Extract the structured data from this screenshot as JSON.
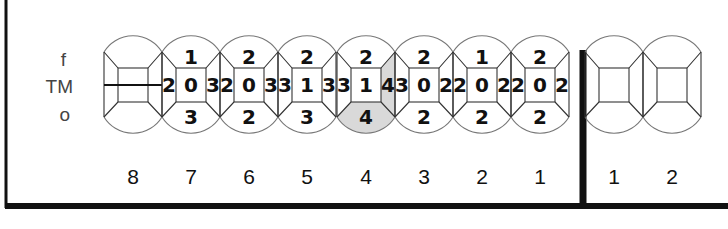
{
  "row_labels": {
    "top": "f",
    "middle": "TM",
    "bottom": "o"
  },
  "colors": {
    "line": "#111111",
    "outline": "#777777",
    "shade": "#d9d9d9"
  },
  "quadrant_left": {
    "teeth": [
      {
        "number": "8",
        "f": "",
        "tm_left": "",
        "tm_center": "",
        "tm_right": "",
        "o": "",
        "missing": true,
        "highlight": []
      },
      {
        "number": "7",
        "f": "1",
        "tm_left": "2",
        "tm_center": "0",
        "tm_right": "3",
        "o": "3",
        "missing": false,
        "highlight": []
      },
      {
        "number": "6",
        "f": "2",
        "tm_left": "2",
        "tm_center": "0",
        "tm_right": "3",
        "o": "2",
        "missing": false,
        "highlight": []
      },
      {
        "number": "5",
        "f": "2",
        "tm_left": "3",
        "tm_center": "1",
        "tm_right": "3",
        "o": "3",
        "missing": false,
        "highlight": []
      },
      {
        "number": "4",
        "f": "2",
        "tm_left": "3",
        "tm_center": "1",
        "tm_right": "4",
        "o": "4",
        "missing": false,
        "highlight": [
          "tm_right",
          "o"
        ]
      },
      {
        "number": "3",
        "f": "2",
        "tm_left": "3",
        "tm_center": "0",
        "tm_right": "2",
        "o": "2",
        "missing": false,
        "highlight": []
      },
      {
        "number": "2",
        "f": "1",
        "tm_left": "2",
        "tm_center": "0",
        "tm_right": "2",
        "o": "2",
        "missing": false,
        "highlight": []
      },
      {
        "number": "1",
        "f": "2",
        "tm_left": "2",
        "tm_center": "0",
        "tm_right": "2",
        "o": "2",
        "missing": false,
        "highlight": []
      }
    ]
  },
  "quadrant_right": {
    "teeth": [
      {
        "number": "1",
        "f": "",
        "tm_left": "",
        "tm_center": "",
        "tm_right": "",
        "o": ""
      },
      {
        "number": "2",
        "f": "",
        "tm_left": "",
        "tm_center": "",
        "tm_right": "",
        "o": ""
      }
    ]
  }
}
